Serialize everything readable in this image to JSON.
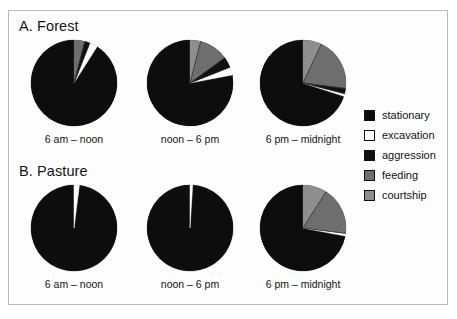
{
  "figure": {
    "panels": [
      {
        "id": "forest",
        "title": "A. Forest"
      },
      {
        "id": "pasture",
        "title": "B. Pasture"
      }
    ],
    "period_labels": [
      "6 am – noon",
      "noon – 6 pm",
      "6 pm – midnight"
    ]
  },
  "legend": {
    "position": "right",
    "items": [
      {
        "label": "stationary",
        "color": "#0d0d0d"
      },
      {
        "label": "excavation",
        "color": "#ffffff"
      },
      {
        "label": "aggression",
        "color": "#111111"
      },
      {
        "label": "feeding",
        "color": "#6e6e6e"
      },
      {
        "label": "courtship",
        "color": "#8e8e8e"
      }
    ]
  },
  "chart_data": [
    {
      "type": "pie",
      "title": "A. Forest",
      "subtitle": "6 am – noon",
      "panel": "forest",
      "period": "6 am – noon",
      "labels": [
        "stationary",
        "excavation",
        "aggression",
        "feeding",
        "courtship"
      ],
      "colors": [
        "#0d0d0d",
        "#ffffff",
        "#111111",
        "#6e6e6e",
        "#8e8e8e"
      ],
      "values": [
        91,
        3,
        2,
        4,
        0
      ],
      "units": "percent",
      "start_angle_deg": 0,
      "direction": "counterclockwise"
    },
    {
      "type": "pie",
      "title": "A. Forest",
      "subtitle": "noon – 6 pm",
      "panel": "forest",
      "period": "noon – 6 pm",
      "labels": [
        "stationary",
        "excavation",
        "aggression",
        "feeding",
        "courtship"
      ],
      "colors": [
        "#0d0d0d",
        "#ffffff",
        "#111111",
        "#6e6e6e",
        "#8e8e8e"
      ],
      "values": [
        78,
        3,
        4,
        11,
        4
      ],
      "units": "percent",
      "start_angle_deg": 0,
      "direction": "counterclockwise"
    },
    {
      "type": "pie",
      "title": "A. Forest",
      "subtitle": "6 pm – midnight",
      "panel": "forest",
      "period": "6 pm – midnight",
      "labels": [
        "stationary",
        "excavation",
        "aggression",
        "feeding",
        "courtship"
      ],
      "colors": [
        "#0d0d0d",
        "#ffffff",
        "#111111",
        "#6e6e6e",
        "#8e8e8e"
      ],
      "values": [
        70,
        1,
        2,
        20,
        7
      ],
      "units": "percent",
      "start_angle_deg": 0,
      "direction": "counterclockwise"
    },
    {
      "type": "pie",
      "title": "B. Pasture",
      "subtitle": "6 am – noon",
      "panel": "pasture",
      "period": "6 am – noon",
      "labels": [
        "stationary",
        "excavation",
        "aggression",
        "feeding",
        "courtship"
      ],
      "colors": [
        "#0d0d0d",
        "#ffffff",
        "#111111",
        "#6e6e6e",
        "#8e8e8e"
      ],
      "values": [
        98,
        2,
        0,
        0,
        0
      ],
      "units": "percent",
      "start_angle_deg": 0,
      "direction": "counterclockwise"
    },
    {
      "type": "pie",
      "title": "B. Pasture",
      "subtitle": "noon – 6 pm",
      "panel": "pasture",
      "period": "noon – 6 pm",
      "labels": [
        "stationary",
        "excavation",
        "aggression",
        "feeding",
        "courtship"
      ],
      "colors": [
        "#0d0d0d",
        "#ffffff",
        "#111111",
        "#6e6e6e",
        "#8e8e8e"
      ],
      "values": [
        99,
        1,
        0,
        0,
        0
      ],
      "units": "percent",
      "start_angle_deg": 0,
      "direction": "counterclockwise"
    },
    {
      "type": "pie",
      "title": "B. Pasture",
      "subtitle": "6 pm – midnight",
      "panel": "pasture",
      "period": "6 pm – midnight",
      "labels": [
        "stationary",
        "excavation",
        "aggression",
        "feeding",
        "courtship"
      ],
      "colors": [
        "#0d0d0d",
        "#ffffff",
        "#111111",
        "#6e6e6e",
        "#8e8e8e"
      ],
      "values": [
        72,
        1,
        0,
        18,
        9
      ],
      "units": "percent",
      "start_angle_deg": 0,
      "direction": "counterclockwise"
    }
  ],
  "layout": {
    "pie_diameter": 86,
    "pie_centers": [
      {
        "cx": 74,
        "cy": 83
      },
      {
        "cx": 190,
        "cy": 83
      },
      {
        "cx": 303,
        "cy": 83
      },
      {
        "cx": 74,
        "cy": 228
      },
      {
        "cx": 190,
        "cy": 228
      },
      {
        "cx": 303,
        "cy": 228
      }
    ],
    "caption_y": [
      133,
      278
    ]
  }
}
